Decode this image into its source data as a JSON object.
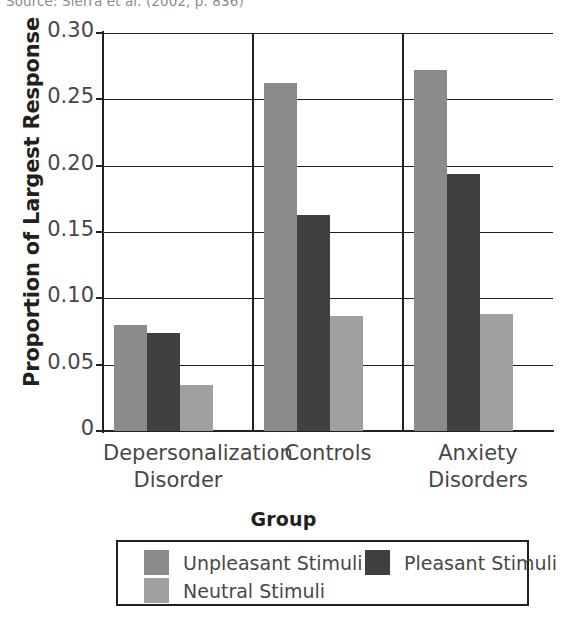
{
  "source_note": "Source: Sierra et al. (2002, p. 836)",
  "chart_data": {
    "type": "bar",
    "title": "",
    "xlabel": "Group",
    "ylabel": "Proportion of Largest Response",
    "categories": [
      "Depersonalization Disorder",
      "Controls",
      "Anxiety Disorders"
    ],
    "category_lines": [
      [
        "Depersonalization",
        "Disorder"
      ],
      [
        "Controls",
        ""
      ],
      [
        "Anxiety",
        "Disorders"
      ]
    ],
    "series": [
      {
        "name": "Unpleasant Stimuli",
        "color": "#8b8b8b",
        "values": [
          0.08,
          0.262,
          0.272
        ]
      },
      {
        "name": "Pleasant Stimuli",
        "color": "#404040",
        "values": [
          0.074,
          0.163,
          0.194
        ]
      },
      {
        "name": "Neutral Stimuli",
        "color": "#a0a0a0",
        "values": [
          0.035,
          0.087,
          0.088
        ]
      }
    ],
    "ylim": [
      0,
      0.3
    ],
    "yticks": [
      0,
      0.05,
      0.1,
      0.15,
      0.2,
      0.25,
      0.3
    ],
    "ytick_labels": [
      "0",
      "0.05",
      "0.10",
      "0.15",
      "0.20",
      "0.25",
      "0.30"
    ],
    "grid": true,
    "legend_position": "bottom"
  },
  "legend": {
    "items": [
      {
        "label": "Unpleasant Stimuli",
        "color": "#8b8b8b"
      },
      {
        "label": "Pleasant Stimuli",
        "color": "#404040"
      },
      {
        "label": "Neutral Stimuli",
        "color": "#a0a0a0"
      }
    ]
  }
}
